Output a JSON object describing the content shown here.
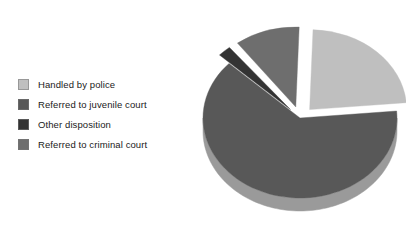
{
  "chart_data": {
    "type": "pie",
    "title": "",
    "subtitle": "",
    "xlabel": "",
    "ylabel": "",
    "grid": false,
    "legend_position": "left",
    "three_d": true,
    "exploded": true,
    "categories": [
      "Handled by police",
      "Referred to juvenile court",
      "Other disposition",
      "Referred to criminal court"
    ],
    "values": [
      22,
      68,
      2,
      8
    ],
    "units": "percent",
    "colors": [
      "#bfbfbf",
      "#585858",
      "#333333",
      "#6e6e6e"
    ],
    "side_colors": [
      "#8e8e8e",
      "#9a9a9a",
      "#1f1f1f",
      "#4a4a4a"
    ],
    "slices": [
      {
        "label": "Handled by police",
        "value": 22,
        "color": "#bfbfbf",
        "side_color": "#8e8e8e",
        "start_angle": -88,
        "end_angle": -5,
        "exploded": true,
        "explode_distance": 14
      },
      {
        "label": "Referred to juvenile court",
        "value": 68,
        "color": "#585858",
        "side_color": "#9a9a9a",
        "start_angle": -5,
        "end_angle": 223,
        "exploded": false,
        "explode_distance": 0
      },
      {
        "label": "Other disposition",
        "value": 2,
        "color": "#333333",
        "side_color": "#1f1f1f",
        "start_angle": 223,
        "end_angle": 231,
        "exploded": true,
        "explode_distance": 14
      },
      {
        "label": "Referred to criminal court",
        "value": 8,
        "color": "#6e6e6e",
        "side_color": "#4a4a4a",
        "start_angle": 233,
        "end_angle": 272,
        "exploded": true,
        "explode_distance": 14
      }
    ]
  },
  "legend": {
    "items": [
      {
        "label": "Handled by police",
        "color": "#bfbfbf"
      },
      {
        "label": "Referred to juvenile court",
        "color": "#585858"
      },
      {
        "label": "Other disposition",
        "color": "#333333"
      },
      {
        "label": "Referred to criminal court",
        "color": "#6e6e6e"
      }
    ]
  },
  "figure": {
    "background": "#ffffff",
    "text_color": "#1a1a1a"
  }
}
